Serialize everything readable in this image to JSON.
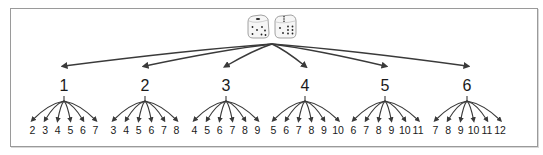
{
  "diagram": {
    "root": {
      "icon": "two-dice-icon",
      "die1_face": 5,
      "die2_face": 6
    },
    "colors": {
      "frame": "#9a9a9a",
      "arrow": "#3a3a3a",
      "text": "#1a1a1a",
      "die_fill": "#f6f6f6",
      "die_edge": "#8a8a8a"
    },
    "first_die": [
      {
        "value": "1",
        "sums": [
          "2",
          "3",
          "4",
          "5",
          "6",
          "7"
        ]
      },
      {
        "value": "2",
        "sums": [
          "3",
          "4",
          "5",
          "6",
          "7",
          "8"
        ]
      },
      {
        "value": "3",
        "sums": [
          "4",
          "5",
          "6",
          "7",
          "8",
          "9"
        ]
      },
      {
        "value": "4",
        "sums": [
          "5",
          "6",
          "7",
          "8",
          "9",
          "10"
        ]
      },
      {
        "value": "5",
        "sums": [
          "6",
          "7",
          "8",
          "9",
          "10",
          "11"
        ]
      },
      {
        "value": "6",
        "sums": [
          "7",
          "8",
          "9",
          "10",
          "11",
          "12"
        ]
      }
    ]
  }
}
